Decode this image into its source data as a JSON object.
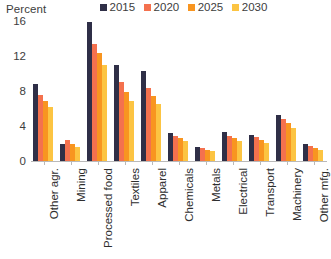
{
  "chart_data": {
    "type": "bar",
    "title": "",
    "subtitle": "",
    "xlabel": "",
    "ylabel": "Percent",
    "ylim": [
      0,
      16
    ],
    "yticks": [
      0,
      4,
      8,
      12,
      16
    ],
    "ytick_labels": [
      "0",
      "4",
      "8",
      "12",
      "16"
    ],
    "grid": false,
    "legend_position": "top-right",
    "orientation": "vertical",
    "categories": [
      "Other agr.",
      "Mining",
      "Processed food",
      "Textiles",
      "Apparel",
      "Chemicals",
      "Metals",
      "Electrical",
      "Transport",
      "Machinery",
      "Other mfg."
    ],
    "series": [
      {
        "name": "2015",
        "color": "#2f2f47",
        "values": [
          8.8,
          2.0,
          15.9,
          11.0,
          10.3,
          3.2,
          1.6,
          3.3,
          3.0,
          5.3,
          1.9
        ]
      },
      {
        "name": "2020",
        "color": "#f4714e",
        "values": [
          7.6,
          2.4,
          13.4,
          9.0,
          8.3,
          2.9,
          1.5,
          2.9,
          2.7,
          4.8,
          1.7
        ]
      },
      {
        "name": "2025",
        "color": "#f89520",
        "values": [
          6.9,
          2.0,
          12.4,
          7.9,
          7.4,
          2.6,
          1.3,
          2.6,
          2.4,
          4.3,
          1.5
        ]
      },
      {
        "name": "2030",
        "color": "#fcc442",
        "values": [
          6.2,
          1.6,
          11.0,
          6.9,
          6.5,
          2.3,
          1.1,
          2.3,
          2.1,
          3.8,
          1.3
        ]
      }
    ]
  },
  "axis": {
    "unit_label": "Percent"
  },
  "legend": {
    "entries": [
      {
        "label": "2015",
        "color": "#2f2f47"
      },
      {
        "label": "2020",
        "color": "#f4714e"
      },
      {
        "label": "2025",
        "color": "#f89520"
      },
      {
        "label": "2030",
        "color": "#fcc442"
      }
    ]
  },
  "colors": {
    "axis_line": "#b9b9b9",
    "text": "#2e2e2e",
    "background": "#ffffff"
  }
}
